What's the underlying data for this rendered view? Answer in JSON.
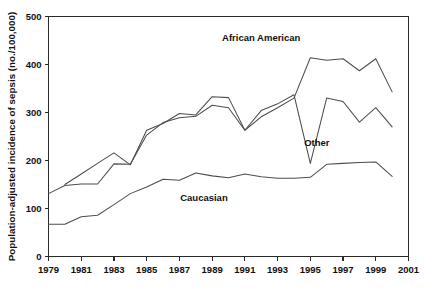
{
  "chart_data": {
    "type": "line",
    "title": "",
    "subtitle": "",
    "xlabel": "",
    "ylabel": "Population-adjusted incidence of sepsis (no./100,000)",
    "xlim": [
      1979,
      2001
    ],
    "ylim": [
      0,
      500
    ],
    "grid": false,
    "legend_position": "inline-annotations",
    "x_ticks": [
      1979,
      1981,
      1983,
      1985,
      1987,
      1989,
      1991,
      1993,
      1995,
      1997,
      1999,
      2001
    ],
    "x_tick_labels": [
      "1979",
      "1981",
      "1983",
      "1985",
      "1987",
      "1989",
      "1991",
      "1993",
      "1995",
      "1997",
      "1999",
      "2001"
    ],
    "y_ticks": [
      0,
      100,
      200,
      300,
      400,
      500
    ],
    "y_tick_labels": [
      "0",
      "100",
      "200",
      "300",
      "400",
      "500"
    ],
    "series": [
      {
        "name": "African American",
        "color": "#4d4d4d",
        "x": [
          1979,
          1980,
          1981,
          1982,
          1983,
          1984,
          1985,
          1986,
          1987,
          1988,
          1989,
          1990,
          1991,
          1992,
          1993,
          1994,
          1995,
          1996,
          1997,
          1998,
          1999,
          2000
        ],
        "values": [
          131,
          148,
          151,
          151,
          193,
          192,
          253,
          279,
          289,
          292,
          315,
          310,
          263,
          291,
          310,
          330,
          414,
          409,
          412,
          387,
          412,
          343
        ]
      },
      {
        "name": "Other",
        "color": "#4d4d4d",
        "x": [
          1980,
          1981,
          1982,
          1983,
          1984,
          1985,
          1986,
          1987,
          1988,
          1989,
          1990,
          1991,
          1992,
          1993,
          1994,
          1995,
          1996,
          1997,
          1998,
          1999,
          2000
        ],
        "values": [
          150,
          172,
          194,
          216,
          191,
          263,
          277,
          298,
          295,
          333,
          331,
          263,
          304,
          318,
          337,
          194,
          330,
          323,
          280,
          310,
          270
        ]
      },
      {
        "name": "Caucasian",
        "color": "#4d4d4d",
        "x": [
          1979,
          1980,
          1981,
          1982,
          1983,
          1984,
          1985,
          1986,
          1987,
          1988,
          1989,
          1990,
          1991,
          1992,
          1993,
          1994,
          1995,
          1996,
          1997,
          1998,
          1999,
          2000
        ],
        "values": [
          67,
          67,
          83,
          86,
          108,
          131,
          145,
          161,
          159,
          174,
          168,
          164,
          172,
          166,
          163,
          163,
          165,
          192,
          194,
          196,
          197,
          167
        ]
      }
    ],
    "annotations": [
      {
        "text": "African American",
        "x": 1992.0,
        "y": 448
      },
      {
        "text": "Other",
        "x": 1995.4,
        "y": 230
      },
      {
        "text": "Caucasian",
        "x": 1988.5,
        "y": 116
      }
    ]
  }
}
